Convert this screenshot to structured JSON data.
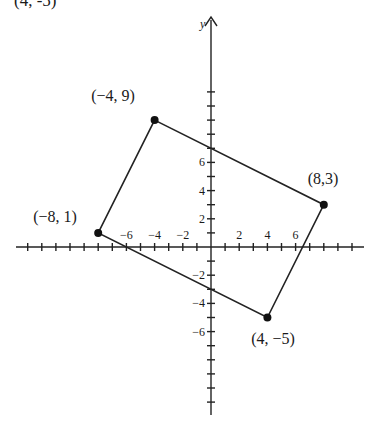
{
  "title_fragment": "(4, -5)",
  "axes": {
    "x_label": "x",
    "y_label": "y",
    "x_ticks": [
      {
        "value": -6,
        "label": "−6"
      },
      {
        "value": -4,
        "label": "−4"
      },
      {
        "value": -2,
        "label": "−2"
      },
      {
        "value": 2,
        "label": "2"
      },
      {
        "value": 4,
        "label": "4"
      },
      {
        "value": 6,
        "label": "6"
      }
    ],
    "y_ticks": [
      {
        "value": 6,
        "label": "6"
      },
      {
        "value": 4,
        "label": "4"
      },
      {
        "value": 2,
        "label": "2"
      },
      {
        "value": -2,
        "label": "−2"
      },
      {
        "value": -4,
        "label": "−4"
      },
      {
        "value": -6,
        "label": "−6"
      }
    ]
  },
  "vertices": [
    {
      "x": -4,
      "y": 9,
      "label": "(−4, 9)"
    },
    {
      "x": 8,
      "y": 3,
      "label": "(8,3)"
    },
    {
      "x": 4,
      "y": -5,
      "label": "(4, −5)"
    },
    {
      "x": -8,
      "y": 1,
      "label": "(−8, 1)"
    }
  ],
  "chart_data": {
    "type": "scatter",
    "title": "",
    "points": [
      {
        "x": -4,
        "y": 9,
        "label": "(-4, 9)"
      },
      {
        "x": 8,
        "y": 3,
        "label": "(8,3)"
      },
      {
        "x": 4,
        "y": -5,
        "label": "(4, -5)"
      },
      {
        "x": -8,
        "y": 1,
        "label": "(-8, 1)"
      }
    ],
    "polygon": [
      [
        -4,
        9
      ],
      [
        8,
        3
      ],
      [
        4,
        -5
      ],
      [
        -8,
        1
      ]
    ],
    "x_tick_labels": [
      "-6",
      "-4",
      "-2",
      "2",
      "4",
      "6"
    ],
    "y_tick_labels": [
      "6",
      "4",
      "2",
      "-2",
      "-4",
      "-6"
    ],
    "xlim": [
      -13.5,
      9.5
    ],
    "ylim": [
      -11.8,
      11.5
    ],
    "ylabel": "y",
    "grid": false
  }
}
